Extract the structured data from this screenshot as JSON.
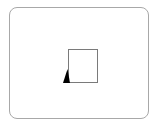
{
  "canvas": {
    "background": "#ffffff",
    "frame_border_color": "#a8a8a8",
    "square_border_color": "#7a7a7a",
    "marker_color": "#000000"
  },
  "elements": {
    "frame": {
      "shape": "rounded-rectangle"
    },
    "square": {
      "shape": "square"
    },
    "marker": {
      "shape": "triangle",
      "icon": "triangle-marker-icon"
    }
  }
}
